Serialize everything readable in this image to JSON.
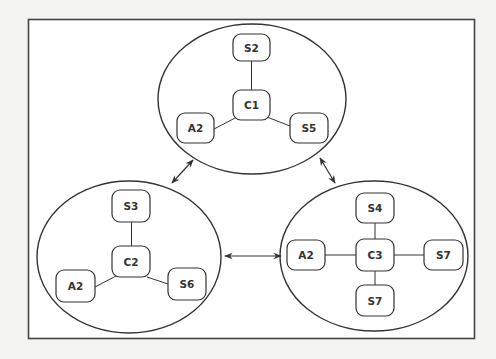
{
  "diagram": {
    "colors": {
      "background": "#f4f4f2",
      "panel": "#ffffff",
      "stroke": "#333333"
    },
    "clusters": [
      {
        "id": "cluster-1",
        "center": {
          "label": "C1"
        },
        "members": [
          {
            "label": "S2",
            "position": "top"
          },
          {
            "label": "A2",
            "position": "bottom-left"
          },
          {
            "label": "S5",
            "position": "bottom-right"
          }
        ]
      },
      {
        "id": "cluster-2",
        "center": {
          "label": "C2"
        },
        "members": [
          {
            "label": "S3",
            "position": "top"
          },
          {
            "label": "A2",
            "position": "bottom-left"
          },
          {
            "label": "S6",
            "position": "bottom-right"
          }
        ]
      },
      {
        "id": "cluster-3",
        "center": {
          "label": "C3"
        },
        "members": [
          {
            "label": "S4",
            "position": "top"
          },
          {
            "label": "A2",
            "position": "left"
          },
          {
            "label": "S7",
            "position": "right"
          },
          {
            "label": "S7",
            "position": "bottom"
          }
        ]
      }
    ],
    "connections": [
      {
        "from": "cluster-1",
        "to": "cluster-2",
        "type": "bidirectional"
      },
      {
        "from": "cluster-1",
        "to": "cluster-3",
        "type": "bidirectional"
      },
      {
        "from": "cluster-2",
        "to": "cluster-3",
        "type": "bidirectional"
      }
    ]
  }
}
